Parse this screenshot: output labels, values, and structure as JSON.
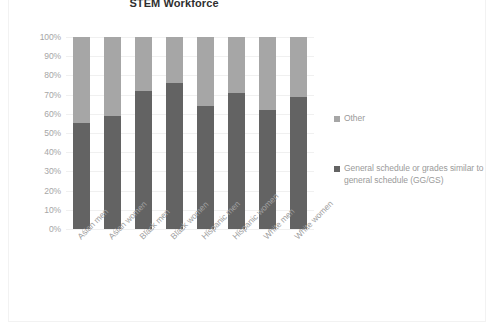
{
  "chart_data": {
    "type": "bar",
    "subtype": "stacked-column-100-percent",
    "title": "STEM Workforce",
    "xlabel": "",
    "ylabel": "",
    "ylim": [
      0,
      100
    ],
    "y_tick_labels": [
      "100%",
      "90%",
      "80%",
      "70%",
      "60%",
      "50%",
      "40%",
      "30%",
      "20%",
      "10%",
      "0%"
    ],
    "y_ticks": [
      100,
      90,
      80,
      70,
      60,
      50,
      40,
      30,
      20,
      10,
      0
    ],
    "grid": true,
    "legend_position": "right",
    "categories": [
      "Asian men",
      "Asian women",
      "Black men",
      "Black women",
      "Hispanic men",
      "Hispanic women",
      "White men",
      "White women"
    ],
    "series": [
      {
        "name": "General schedule or grades similar to general schedule (GG/GS)",
        "color": "#636363",
        "values": [
          55,
          59,
          72,
          76,
          64,
          71,
          62,
          69
        ]
      },
      {
        "name": "Other",
        "color": "#a6a6a6",
        "values": [
          45,
          41,
          28,
          24,
          36,
          29,
          38,
          31
        ]
      }
    ]
  },
  "legend": {
    "entries": [
      {
        "label": "Other",
        "color": "#a6a6a6"
      },
      {
        "label": "General schedule or grades similar to general schedule (GG/GS)",
        "color": "#636363"
      }
    ]
  },
  "colors": {
    "series_other": "#a6a6a6",
    "series_ggs": "#636363",
    "gridline": "#f0f0f0",
    "axis_text": "#a6a6a6",
    "title_text": "#2f2f2f",
    "frame_border": "#f2f2f2"
  }
}
